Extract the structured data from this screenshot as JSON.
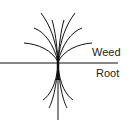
{
  "diagram": {
    "labels": {
      "upper": "Weed",
      "lower": "Root"
    },
    "colors": {
      "stroke": "#111111",
      "background": "#ffffff"
    }
  }
}
